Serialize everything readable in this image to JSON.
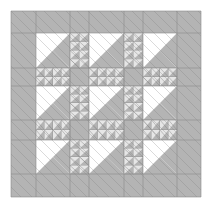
{
  "image": {
    "kind": "quilt-pattern",
    "width": 211,
    "height": 209,
    "colors": {
      "background": "#ffffff",
      "grey": "#b4b4b4",
      "light": "#ffffff",
      "patch_light": "#e6e6e6",
      "line": "#7a7a7a",
      "grid": "#8c8c8c"
    },
    "grid": {
      "cols": [
        11,
        36,
        70,
        89,
        124,
        143,
        177,
        201
      ],
      "rows": [
        11,
        33,
        68,
        86,
        120,
        140,
        174,
        197
      ]
    }
  },
  "caption": ""
}
